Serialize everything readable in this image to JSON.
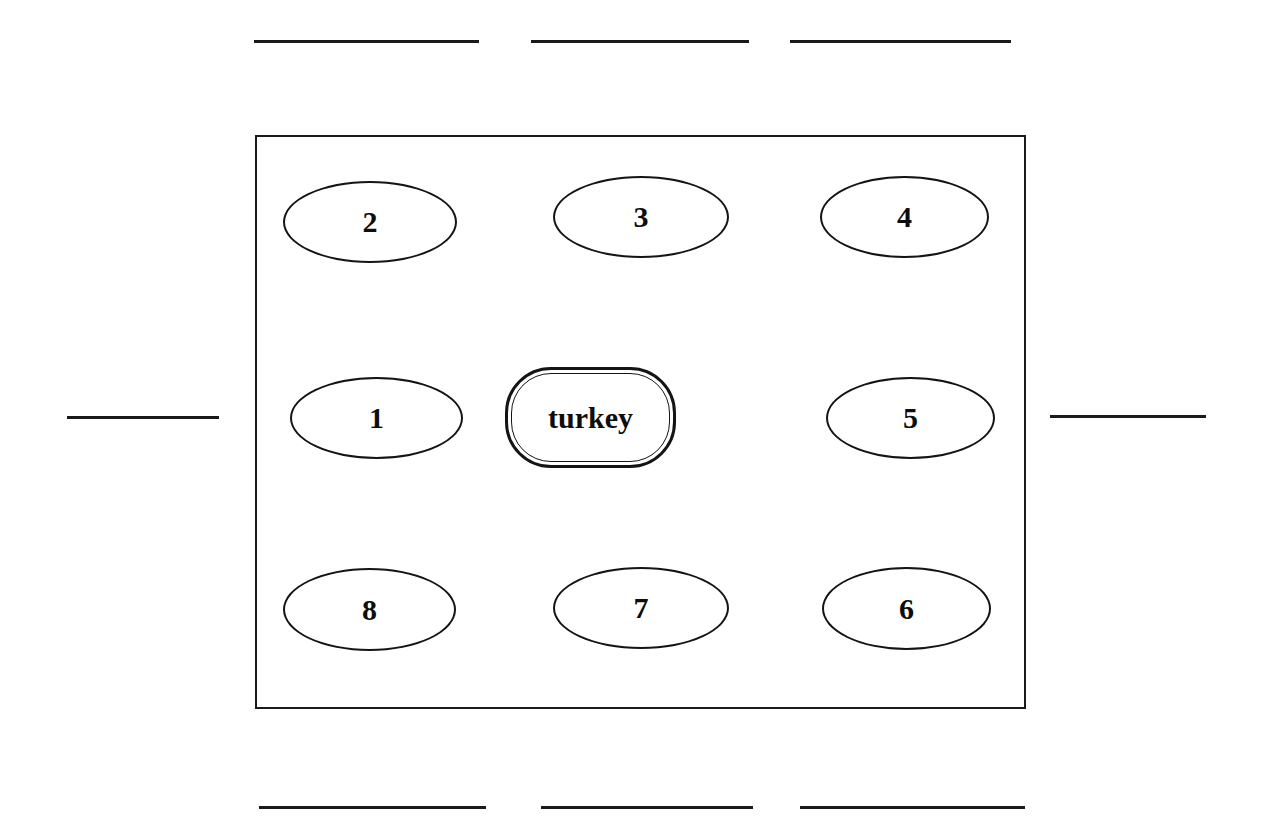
{
  "diagram": {
    "background_color": "#ffffff",
    "stroke_color": "#141414",
    "center": {
      "label": "turkey",
      "shape": "rounded-rectangle-double",
      "x": 505,
      "y": 367,
      "width": 171,
      "height": 101
    },
    "outer_box": {
      "x": 255,
      "y": 135,
      "width": 771,
      "height": 574,
      "shape": "rectangle"
    },
    "nodes": [
      {
        "label": "2",
        "shape": "ellipse",
        "x": 283,
        "y": 181,
        "width": 174,
        "height": 82
      },
      {
        "label": "3",
        "shape": "ellipse",
        "x": 553,
        "y": 176,
        "width": 176,
        "height": 82
      },
      {
        "label": "4",
        "shape": "ellipse",
        "x": 820,
        "y": 176,
        "width": 169,
        "height": 82
      },
      {
        "label": "1",
        "shape": "ellipse",
        "x": 290,
        "y": 377,
        "width": 173,
        "height": 82
      },
      {
        "label": "5",
        "shape": "ellipse",
        "x": 826,
        "y": 377,
        "width": 169,
        "height": 82
      },
      {
        "label": "8",
        "shape": "ellipse",
        "x": 283,
        "y": 568,
        "width": 173,
        "height": 83
      },
      {
        "label": "7",
        "shape": "ellipse",
        "x": 553,
        "y": 567,
        "width": 176,
        "height": 82
      },
      {
        "label": "6",
        "shape": "ellipse",
        "x": 822,
        "y": 567,
        "width": 169,
        "height": 83
      }
    ],
    "rules": [
      {
        "name": "write-line-top-left",
        "x": 254,
        "y": 40,
        "width": 225
      },
      {
        "name": "write-line-top-center",
        "x": 531,
        "y": 40,
        "width": 218
      },
      {
        "name": "write-line-top-right",
        "x": 790,
        "y": 40,
        "width": 221
      },
      {
        "name": "write-line-left",
        "x": 67,
        "y": 416,
        "width": 152
      },
      {
        "name": "write-line-right",
        "x": 1050,
        "y": 415,
        "width": 156
      },
      {
        "name": "write-line-bottom-left",
        "x": 259,
        "y": 806,
        "width": 227
      },
      {
        "name": "write-line-bottom-center",
        "x": 541,
        "y": 806,
        "width": 212
      },
      {
        "name": "write-line-bottom-right",
        "x": 800,
        "y": 806,
        "width": 225
      }
    ]
  }
}
